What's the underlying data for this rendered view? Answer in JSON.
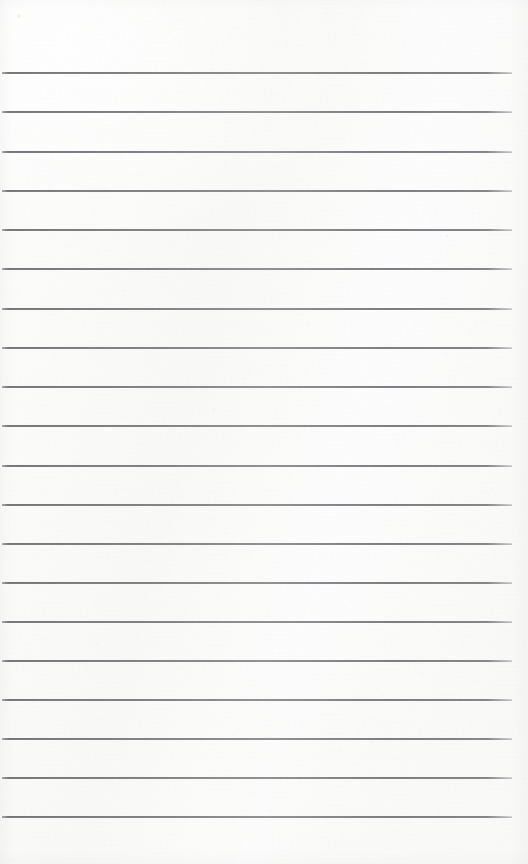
{
  "document": {
    "kind": "lined-notebook-paper",
    "title": "Blank ruled paper sheet",
    "content_text": "",
    "handwriting": "",
    "page_number": "",
    "width_px": 528,
    "height_px": 864
  },
  "paper": {
    "background_color": "#fcfcfb",
    "tint_color": "#f9f9f7",
    "edge_shadow_color": "#000000",
    "texture": "subtle paper fiber speckle"
  },
  "ruling": {
    "line_color": "#6d7075",
    "line_count": 20,
    "first_line_y": 72,
    "line_spacing_px": 39.2,
    "line_thickness_px": 1.5,
    "line_start_x": 2,
    "line_end_x": 512,
    "margin_rule": "none",
    "lines": [
      {
        "index": 1,
        "y": 72,
        "x1": 2,
        "x2": 512
      },
      {
        "index": 2,
        "y": 111,
        "x1": 2,
        "x2": 512
      },
      {
        "index": 3,
        "y": 151,
        "x1": 2,
        "x2": 512
      },
      {
        "index": 4,
        "y": 190,
        "x1": 2,
        "x2": 512
      },
      {
        "index": 5,
        "y": 229,
        "x1": 2,
        "x2": 512
      },
      {
        "index": 6,
        "y": 268,
        "x1": 2,
        "x2": 512
      },
      {
        "index": 7,
        "y": 308,
        "x1": 2,
        "x2": 512
      },
      {
        "index": 8,
        "y": 347,
        "x1": 2,
        "x2": 512
      },
      {
        "index": 9,
        "y": 386,
        "x1": 2,
        "x2": 512
      },
      {
        "index": 10,
        "y": 425,
        "x1": 2,
        "x2": 512
      },
      {
        "index": 11,
        "y": 465,
        "x1": 2,
        "x2": 512
      },
      {
        "index": 12,
        "y": 504,
        "x1": 2,
        "x2": 512
      },
      {
        "index": 13,
        "y": 543,
        "x1": 2,
        "x2": 512
      },
      {
        "index": 14,
        "y": 582,
        "x1": 2,
        "x2": 512
      },
      {
        "index": 15,
        "y": 621,
        "x1": 2,
        "x2": 512
      },
      {
        "index": 16,
        "y": 660,
        "x1": 2,
        "x2": 512
      },
      {
        "index": 17,
        "y": 699,
        "x1": 2,
        "x2": 512
      },
      {
        "index": 18,
        "y": 738,
        "x1": 2,
        "x2": 512
      },
      {
        "index": 19,
        "y": 777,
        "x1": 2,
        "x2": 512
      },
      {
        "index": 20,
        "y": 816,
        "x1": 2,
        "x2": 512
      }
    ]
  }
}
